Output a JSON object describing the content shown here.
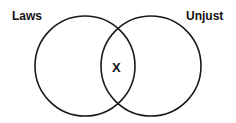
{
  "diagram": {
    "type": "venn",
    "sets": [
      {
        "label": "Laws",
        "cx": 85,
        "cy": 66,
        "r": 50
      },
      {
        "label": "Unjust",
        "cx": 151,
        "cy": 66,
        "r": 50
      }
    ],
    "intersection_mark": "X",
    "stroke_color": "#1a1a1a",
    "background": "#ffffff"
  }
}
